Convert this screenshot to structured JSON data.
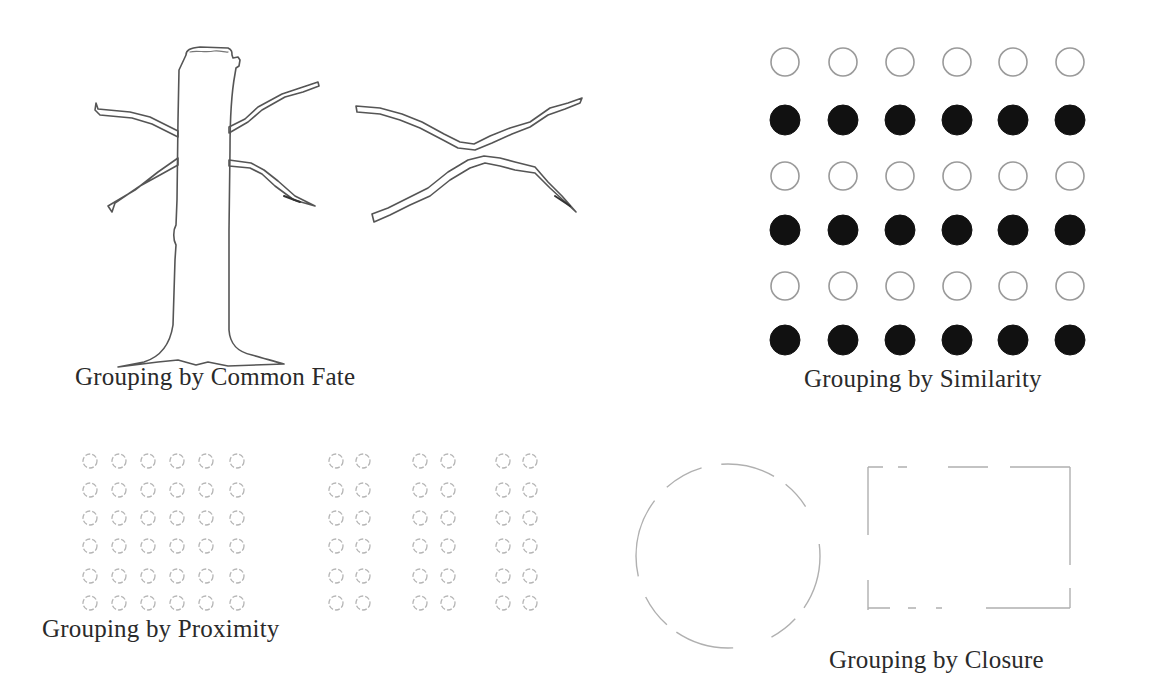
{
  "figure": {
    "topic": "Gestalt principles of perceptual grouping",
    "panels": [
      {
        "id": "common-fate",
        "caption": "Grouping by Common Fate",
        "elements": [
          "tree trunk with four branches",
          "two detached crossing branches"
        ]
      },
      {
        "id": "similarity",
        "caption": "Grouping by Similarity",
        "grid": {
          "rows": 6,
          "cols": 6,
          "row_pattern": [
            "hollow",
            "filled",
            "hollow",
            "filled",
            "hollow",
            "filled"
          ]
        }
      },
      {
        "id": "proximity",
        "caption": "Grouping by Proximity",
        "left_block": {
          "rows": 6,
          "cols": 6,
          "spacing": "even"
        },
        "right_block": {
          "rows": 6,
          "column_pairs": 3,
          "spacing": "paired"
        }
      },
      {
        "id": "closure",
        "caption": "Grouping by Closure",
        "elements": [
          "broken circle",
          "broken rectangle"
        ]
      }
    ],
    "colors": {
      "background": "#ffffff",
      "ink": "#2a2a2a",
      "filled_dot": "#111111",
      "hollow_stroke": "#9a9a9a",
      "faint_stroke": "#b5b5b5"
    }
  }
}
